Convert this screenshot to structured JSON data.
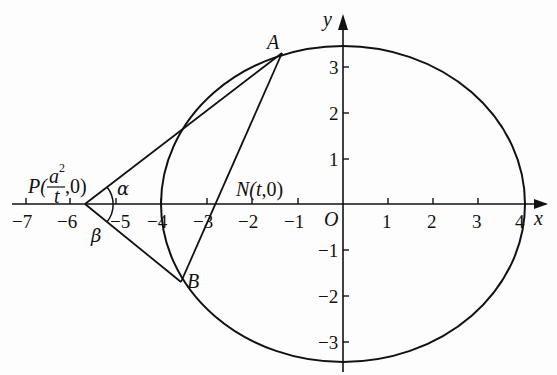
{
  "diagram": {
    "type": "coordinate-geometry",
    "axes": {
      "x_label": "x",
      "y_label": "y",
      "origin_label": "O",
      "x_ticks": [
        "−7",
        "−6",
        "−5",
        "−4",
        "−3",
        "−2",
        "−1",
        "1",
        "2",
        "3",
        "4"
      ],
      "y_ticks": [
        "3",
        "2",
        "1",
        "−1",
        "−2",
        "−3"
      ]
    },
    "ellipse": {
      "a": 4,
      "b": 3.46
    },
    "points": {
      "A": {
        "label": "A",
        "x": -1.4,
        "y": 3.2
      },
      "B": {
        "label": "B",
        "x": -3.5,
        "y": -1.7
      },
      "N": {
        "label_prefix": "N(",
        "label_var": "t",
        "label_suffix": ",0)",
        "x": -2.85,
        "y": 0
      },
      "P": {
        "label_prefix": "P(",
        "numerator": "a",
        "exponent": "2",
        "denominator": "t",
        "label_suffix": ",0)",
        "x": -5.67,
        "y": 0
      }
    },
    "angles": {
      "alpha": "α",
      "beta": "β"
    },
    "colors": {
      "stroke": "#111111",
      "background": "#fdfdfd"
    }
  }
}
